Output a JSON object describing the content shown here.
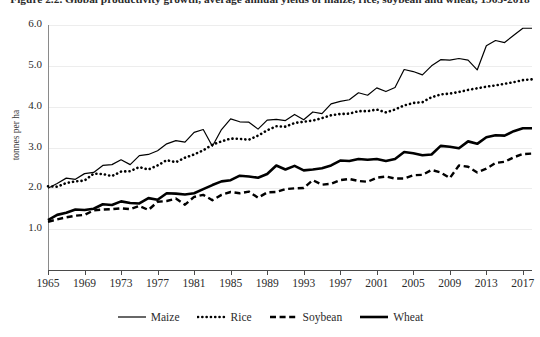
{
  "chart_data": {
    "type": "line",
    "title": "Figure 2.2. Global productivity growth, average annual yields of maize, rice, soybean and wheat, 1965-2018",
    "subtitle": "",
    "xlabel": "",
    "ylabel": "tonnes per ha",
    "xlim": [
      1965,
      2018
    ],
    "ylim": [
      0.0,
      6.0
    ],
    "grid": true,
    "legend_position": "bottom",
    "y_ticks": [
      "1.0",
      "2.0",
      "3.0",
      "4.0",
      "5.0",
      "6.0"
    ],
    "y_tick_values": [
      1.0,
      2.0,
      3.0,
      4.0,
      5.0,
      6.0
    ],
    "x_ticks": [
      "1965",
      "1969",
      "1973",
      "1977",
      "1981",
      "1985",
      "1989",
      "1993",
      "1997",
      "2001",
      "2005",
      "2009",
      "2013",
      "2017"
    ],
    "x_tick_values": [
      1965,
      1969,
      1973,
      1977,
      1981,
      1985,
      1989,
      1993,
      1997,
      2001,
      2005,
      2009,
      2013,
      2017
    ],
    "x": [
      1965,
      1966,
      1967,
      1968,
      1969,
      1970,
      1971,
      1972,
      1973,
      1974,
      1975,
      1976,
      1977,
      1978,
      1979,
      1980,
      1981,
      1982,
      1983,
      1984,
      1985,
      1986,
      1987,
      1988,
      1989,
      1990,
      1991,
      1992,
      1993,
      1994,
      1995,
      1996,
      1997,
      1998,
      1999,
      2000,
      2001,
      2002,
      2003,
      2004,
      2005,
      2006,
      2007,
      2008,
      2009,
      2010,
      2011,
      2012,
      2013,
      2014,
      2015,
      2016,
      2017,
      2018
    ],
    "series": [
      {
        "name": "Maize",
        "style": "solid-thin",
        "color": "#000000",
        "values": [
          2.0,
          2.12,
          2.25,
          2.22,
          2.36,
          2.39,
          2.56,
          2.58,
          2.7,
          2.58,
          2.8,
          2.83,
          2.92,
          3.09,
          3.17,
          3.13,
          3.37,
          3.44,
          3.03,
          3.44,
          3.7,
          3.63,
          3.62,
          3.45,
          3.67,
          3.69,
          3.66,
          3.81,
          3.68,
          3.87,
          3.83,
          4.07,
          4.13,
          4.17,
          4.34,
          4.28,
          4.46,
          4.37,
          4.47,
          4.91,
          4.86,
          4.78,
          5.0,
          5.15,
          5.14,
          5.18,
          5.14,
          4.9,
          5.49,
          5.62,
          5.57,
          5.75,
          5.92,
          5.92
        ],
        "start_value": 2.0,
        "end_value": 5.75,
        "notes": "thin solid line, highest yields, notable dips 1983 and 2012"
      },
      {
        "name": "Rice",
        "style": "dotted",
        "color": "#000000",
        "values": [
          2.05,
          2.04,
          2.13,
          2.17,
          2.19,
          2.36,
          2.35,
          2.3,
          2.41,
          2.42,
          2.52,
          2.46,
          2.56,
          2.69,
          2.64,
          2.75,
          2.83,
          2.93,
          3.07,
          3.15,
          3.22,
          3.21,
          3.19,
          3.29,
          3.42,
          3.52,
          3.51,
          3.6,
          3.63,
          3.66,
          3.72,
          3.79,
          3.82,
          3.83,
          3.89,
          3.89,
          3.93,
          3.86,
          3.93,
          4.03,
          4.09,
          4.11,
          4.23,
          4.3,
          4.32,
          4.36,
          4.41,
          4.45,
          4.49,
          4.52,
          4.56,
          4.6,
          4.65,
          4.67
        ],
        "start_value": 2.05,
        "end_value": 4.6,
        "notes": "dotted line, second highest"
      },
      {
        "name": "Soybean",
        "style": "dashed",
        "color": "#000000",
        "values": [
          1.18,
          1.24,
          1.29,
          1.33,
          1.35,
          1.46,
          1.48,
          1.49,
          1.51,
          1.49,
          1.57,
          1.47,
          1.67,
          1.69,
          1.75,
          1.6,
          1.79,
          1.84,
          1.71,
          1.84,
          1.91,
          1.88,
          1.92,
          1.77,
          1.9,
          1.91,
          1.98,
          2.0,
          2.01,
          2.2,
          2.09,
          2.11,
          2.2,
          2.23,
          2.18,
          2.16,
          2.26,
          2.29,
          2.24,
          2.24,
          2.32,
          2.33,
          2.45,
          2.39,
          2.25,
          2.56,
          2.53,
          2.39,
          2.48,
          2.62,
          2.65,
          2.76,
          2.84,
          2.85
        ],
        "start_value": 1.18,
        "end_value": 2.76,
        "notes": "dashed line, lowest at the end"
      },
      {
        "name": "Wheat",
        "style": "solid-thick",
        "color": "#000000",
        "values": [
          1.22,
          1.35,
          1.4,
          1.48,
          1.47,
          1.5,
          1.61,
          1.59,
          1.68,
          1.64,
          1.63,
          1.76,
          1.72,
          1.88,
          1.87,
          1.85,
          1.88,
          1.98,
          2.08,
          2.17,
          2.2,
          2.31,
          2.29,
          2.26,
          2.35,
          2.56,
          2.46,
          2.55,
          2.44,
          2.46,
          2.49,
          2.56,
          2.68,
          2.67,
          2.72,
          2.7,
          2.72,
          2.67,
          2.72,
          2.89,
          2.86,
          2.81,
          2.83,
          3.04,
          3.02,
          2.98,
          3.15,
          3.09,
          3.25,
          3.3,
          3.29,
          3.4,
          3.47,
          3.47
        ],
        "start_value": 1.22,
        "end_value": 3.4,
        "notes": "thick solid line"
      }
    ]
  },
  "legend": {
    "items": [
      {
        "label": "Maize",
        "style": "solid-thin"
      },
      {
        "label": "Rice",
        "style": "dotted"
      },
      {
        "label": "Soybean",
        "style": "dashed"
      },
      {
        "label": "Wheat",
        "style": "solid-thick"
      }
    ]
  },
  "colors": {
    "line": "#000000",
    "axis": "#4a4a4a",
    "grid": "#ededed",
    "text": "#2b2b2b",
    "background": "#ffffff"
  }
}
